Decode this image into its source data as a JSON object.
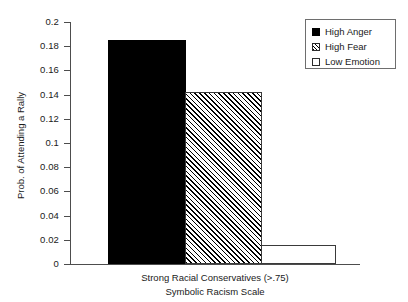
{
  "chart_data": {
    "type": "bar",
    "title": "",
    "xlabel": "Symbolic Racism Scale",
    "group_label": "Strong Racial Conservatives (>.75)",
    "ylabel": "Prob. of Attending a Rally",
    "ylim": [
      0,
      0.2
    ],
    "ytick_labels": [
      "0.2",
      "0.18",
      "0.16",
      "0.14",
      "0.12",
      "0.1",
      "0.08",
      "0.06",
      "0.04",
      "0.02",
      "0"
    ],
    "ytick_values": [
      0.2,
      0.18,
      0.16,
      0.14,
      0.12,
      0.1,
      0.08,
      0.06,
      0.04,
      0.02,
      0
    ],
    "categories": [
      "Strong Racial Conservatives (>.75)"
    ],
    "grid": false,
    "legend_position": "top-right",
    "series": [
      {
        "name": "High Anger",
        "fill": "solid",
        "values": [
          0.185
        ]
      },
      {
        "name": "High Fear",
        "fill": "hatch",
        "values": [
          0.142
        ]
      },
      {
        "name": "Low Emotion",
        "fill": "empty",
        "values": [
          0.016
        ]
      }
    ]
  },
  "legend": {
    "items": [
      {
        "label": "High Anger",
        "swatch": "solid-square-icon"
      },
      {
        "label": "High Fear",
        "swatch": "hatched-square-icon"
      },
      {
        "label": "Low Emotion",
        "swatch": "empty-square-icon"
      }
    ]
  },
  "axes": {
    "y_title": "Prob. of Attending a Rally",
    "x_line_1": "Strong Racial Conservatives (>.75)",
    "x_line_2": "Symbolic Racism Scale"
  }
}
